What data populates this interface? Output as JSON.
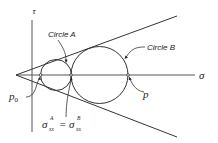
{
  "figure": {
    "type": "mohr-coulomb-diagram",
    "axes": {
      "x_label": "σ",
      "y_label": "τ"
    },
    "circles": [
      {
        "label": "Circle A"
      },
      {
        "label": "Circle B"
      }
    ],
    "points": {
      "p0": {
        "base": "p",
        "sub": "0"
      },
      "p": {
        "label": "p"
      }
    },
    "equation": {
      "lhs_symbol": "σ",
      "lhs_sup": "A",
      "lhs_sub": "xx",
      "equals": "=",
      "rhs_symbol": "σ",
      "rhs_sup": "B",
      "rhs_sub": "xx"
    },
    "colors": {
      "stroke": "#333333",
      "axis": "#555555",
      "text": "#222222",
      "background": "#ffffff"
    }
  }
}
